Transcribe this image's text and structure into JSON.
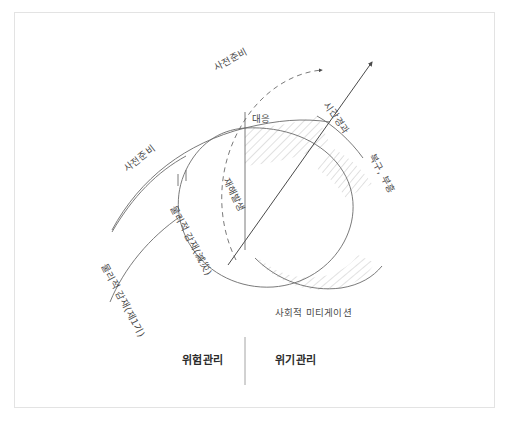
{
  "diagram": {
    "title_visible": false,
    "background_color": "#ffffff",
    "frame_color": "#e3e3e3",
    "stroke_color": "#6b6b6b",
    "hatch_color": "#9a9a9a",
    "text_color": "#4a4a4a",
    "bold_text_color": "#2b2b2b"
  },
  "labels": {
    "prep_upper": "사전준비",
    "prep_left": "사전준비",
    "time_axis": "시간경과",
    "response": "대응",
    "recovery": "복구, 부흥",
    "disaster_occurrence": "재해발생",
    "physical_mitigation_upper": "물리적 감재(減災)",
    "physical_mitigation_lower": "물리적 감재(제1기)",
    "social_mitigation": "사회적 미티게이션",
    "risk_management": "위험관리",
    "crisis_management": "위기관리"
  },
  "elements": {
    "dashed_arc_name": "preparation-dashed-arc",
    "time_arrow_name": "time-axis-arrow",
    "oval_name": "disaster-cycle-oval",
    "vertical_divider_name": "management-divider"
  }
}
